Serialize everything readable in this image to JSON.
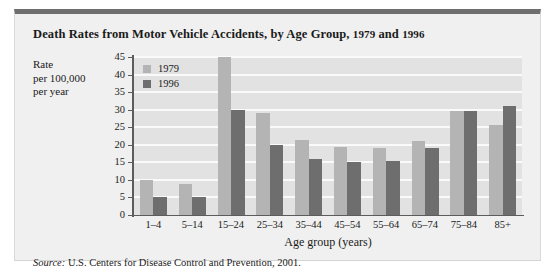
{
  "figure": {
    "title_main": "Death Rates from Motor Vehicle Accidents, by Age Group,",
    "title_year_a": "1979",
    "title_and": "and",
    "title_year_b": "1996",
    "y_axis_title_line1": "Rate",
    "y_axis_title_line2": "per 100,000",
    "y_axis_title_line3": "per year",
    "source_label": "Source:",
    "source_text": "U.S. Centers for Disease Control and Prevention, 2001.",
    "colors": {
      "series_1979": "#b4b4b4",
      "series_1996": "#6e6e6e",
      "plot_background": "#e2e2e2",
      "gridline": "#fafafa",
      "card_background": "#f0f0f0",
      "card_top_rule": "#6f6f6f",
      "axis": "#5c5c5c",
      "text": "#1a1a1a"
    }
  },
  "chart_data": {
    "type": "bar",
    "title": "Death Rates from Motor Vehicle Accidents, by Age Group, 1979 and 1996",
    "xlabel": "Age group (years)",
    "ylabel": "Rate per 100,000 per year",
    "categories": [
      "1–4",
      "5–14",
      "15–24",
      "25–34",
      "35–44",
      "45–54",
      "55–64",
      "65–74",
      "75–84",
      "85+"
    ],
    "series": [
      {
        "name": "1979",
        "color": "#b4b4b4",
        "values": [
          10.0,
          8.7,
          46.5,
          29.0,
          21.5,
          19.5,
          19.0,
          21.0,
          29.5,
          25.5
        ]
      },
      {
        "name": "1996",
        "color": "#6e6e6e",
        "values": [
          5.2,
          5.2,
          30.0,
          19.8,
          16.0,
          15.0,
          15.5,
          19.2,
          29.5,
          31.0
        ]
      }
    ],
    "ylim": [
      0,
      45
    ],
    "yticks": [
      0,
      5,
      10,
      15,
      20,
      25,
      30,
      35,
      40,
      45
    ],
    "ytick_labels": [
      "0",
      "5",
      "10",
      "15",
      "20",
      "25",
      "30",
      "35",
      "40",
      "45"
    ],
    "grid": true,
    "grid_axis": "y",
    "legend": [
      "1979",
      "1996"
    ],
    "legend_position": "top-left-inside"
  }
}
